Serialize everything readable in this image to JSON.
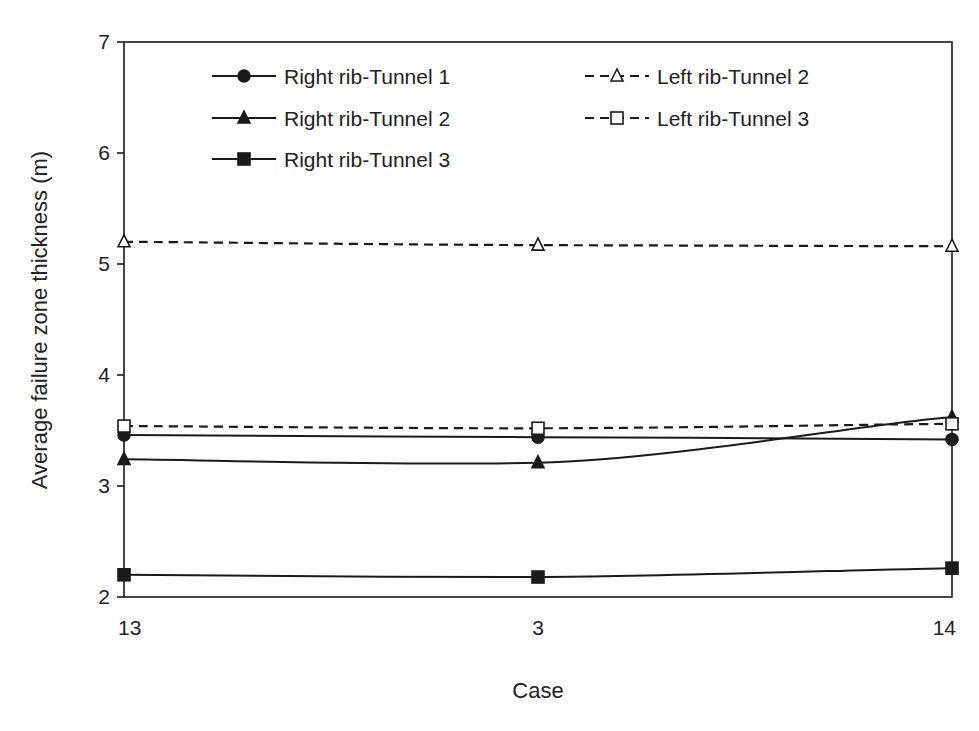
{
  "chart_data": {
    "type": "line",
    "title": "",
    "xlabel": "Case",
    "ylabel": "Average failure zone thickness (m)",
    "categories": [
      "13",
      "3",
      "14"
    ],
    "ylim": [
      2,
      7
    ],
    "yticks": [
      2,
      3,
      4,
      5,
      6,
      7
    ],
    "grid": false,
    "legend_position": "upper inside, two columns",
    "series": [
      {
        "name": "Right rib-Tunnel 1",
        "marker": "circle-filled",
        "line": "solid",
        "values": [
          3.46,
          3.44,
          3.42
        ]
      },
      {
        "name": "Right rib-Tunnel 2",
        "marker": "triangle-filled",
        "line": "solid",
        "values": [
          3.24,
          3.21,
          3.62
        ]
      },
      {
        "name": "Right rib-Tunnel 3",
        "marker": "square-filled",
        "line": "solid",
        "values": [
          2.2,
          2.18,
          2.26
        ]
      },
      {
        "name": "Left rib-Tunnel 2",
        "marker": "triangle-open",
        "line": "dashed",
        "values": [
          5.2,
          5.17,
          5.16
        ]
      },
      {
        "name": "Left rib-Tunnel 3",
        "marker": "square-open",
        "line": "dashed",
        "values": [
          3.54,
          3.52,
          3.56
        ]
      }
    ],
    "colors": {
      "line": "#1a1a1a",
      "background": "#ffffff"
    }
  }
}
